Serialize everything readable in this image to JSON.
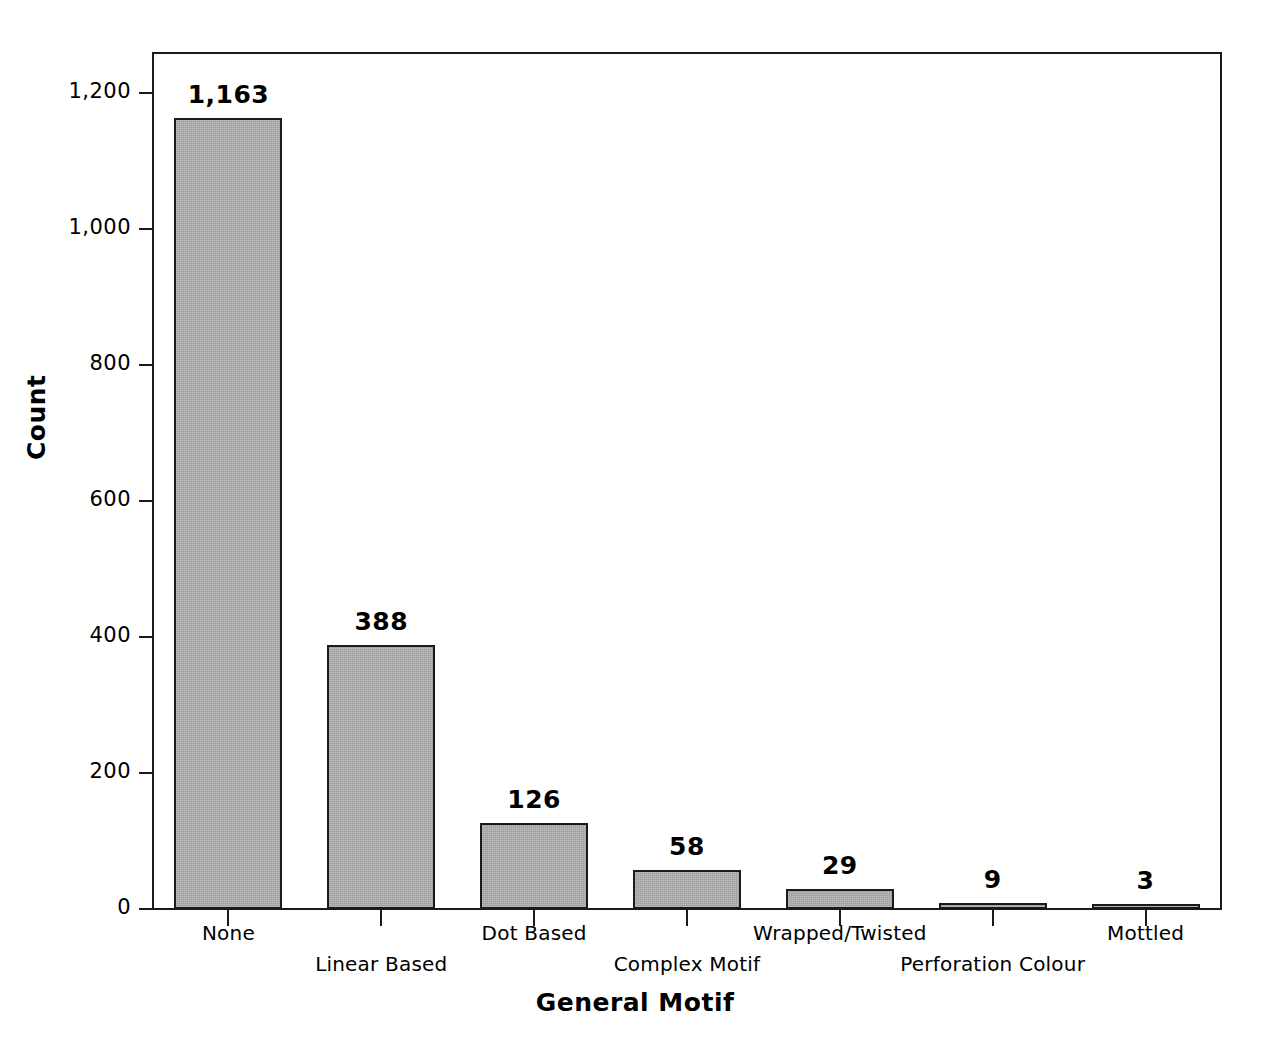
{
  "chart_data": {
    "type": "bar",
    "title": "",
    "xlabel": "General Motif",
    "ylabel": "Count",
    "categories": [
      "None",
      "Linear Based",
      "Dot Based",
      "Complex Motif",
      "Wrapped/Twisted",
      "Perforation Colour",
      "Mottled"
    ],
    "values": [
      1163,
      388,
      126,
      58,
      29,
      9,
      3
    ],
    "value_labels": [
      "1,163",
      "388",
      "126",
      "58",
      "29",
      "9",
      "3"
    ],
    "ylim": [
      0,
      1260
    ],
    "yticks": [
      0,
      200,
      400,
      600,
      800,
      1000,
      1200
    ],
    "ytick_labels": [
      "0",
      "200",
      "400",
      "600",
      "800",
      "1,000",
      "1,200"
    ],
    "grid": false,
    "legend": false,
    "bar_color": "#ababab",
    "bar_edge_color": "#1a1a1a"
  },
  "axes": {
    "y_title": "Count",
    "x_title": "General Motif"
  }
}
